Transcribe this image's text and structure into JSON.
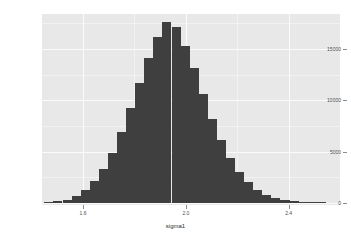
{
  "chart_data": {
    "type": "bar",
    "title": "",
    "subtitle": "",
    "xlabel": "sigma1",
    "ylabel": "",
    "grid": true,
    "legend": "none",
    "xlim": [
      1.44,
      2.6
    ],
    "ylim": [
      0,
      18200
    ],
    "x_ticks": [
      1.6,
      2.0,
      2.4
    ],
    "x_tick_labels": [
      "1.6",
      "2.0",
      "2.4"
    ],
    "y_ticks": [
      0,
      5000,
      10000,
      15000
    ],
    "y_tick_labels": [
      "0",
      "5000",
      "10000",
      "15000"
    ],
    "bar_color": "#3f3f3f",
    "panel_color": "#e8e8e8",
    "gridline_color": "#fbfbfb",
    "bin_width": 0.0353,
    "bin_centers": [
      1.467,
      1.502,
      1.538,
      1.573,
      1.608,
      1.644,
      1.679,
      1.714,
      1.75,
      1.785,
      1.82,
      1.856,
      1.891,
      1.926,
      1.962,
      1.997,
      2.032,
      2.068,
      2.103,
      2.138,
      2.174,
      2.209,
      2.244,
      2.28,
      2.315,
      2.35,
      2.386,
      2.421,
      2.456,
      2.492,
      2.527
    ],
    "values": [
      60,
      150,
      330,
      700,
      1250,
      2100,
      3300,
      4900,
      6900,
      9200,
      11700,
      14100,
      16200,
      17600,
      17100,
      15300,
      13100,
      10600,
      8200,
      6100,
      4400,
      3050,
      2000,
      1280,
      790,
      470,
      270,
      150,
      80,
      40,
      20
    ],
    "categories": [
      "1.467",
      "1.502",
      "1.538",
      "1.573",
      "1.608",
      "1.644",
      "1.679",
      "1.714",
      "1.750",
      "1.785",
      "1.820",
      "1.856",
      "1.891",
      "1.926",
      "1.962",
      "1.997",
      "2.032",
      "2.068",
      "2.103",
      "2.138",
      "2.174",
      "2.209",
      "2.244",
      "2.280",
      "2.315",
      "2.350",
      "2.386",
      "2.421",
      "2.456",
      "2.492",
      "2.527"
    ]
  }
}
